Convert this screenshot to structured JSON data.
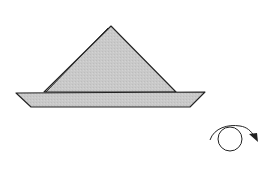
{
  "diagram": {
    "type": "origami-step",
    "colors": {
      "paper_fill": "#c9c9c9",
      "outline": "#222222",
      "background": "#ffffff"
    },
    "shapes": {
      "triangle": {
        "apex": [
          111,
          26
        ],
        "base_left": [
          44,
          92
        ],
        "base_right": [
          176,
          92
        ]
      },
      "brim": {
        "top_left": [
          16,
          93
        ],
        "top_right": [
          205,
          92
        ],
        "bottom_right": [
          190,
          107
        ],
        "bottom_left": [
          31,
          107
        ]
      }
    },
    "symbols": {
      "turn_over": {
        "name": "turn-over-arrow",
        "circle_center": [
          230,
          139
        ],
        "radius": 12
      }
    }
  }
}
